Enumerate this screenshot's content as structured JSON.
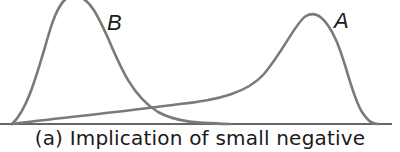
{
  "figure": {
    "curves": [
      {
        "label": "B",
        "description": "left distribution, sharp peak, right-skewed"
      },
      {
        "label": "A",
        "description": "right distribution, long left tail"
      }
    ],
    "caption": "(a)  Implication of small negative",
    "colors": {
      "curve": "#7a7a7a",
      "axis": "#333333",
      "text": "#1a1a1a"
    }
  }
}
